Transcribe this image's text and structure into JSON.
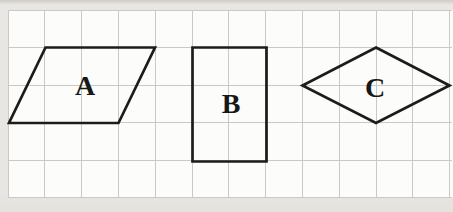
{
  "canvas": {
    "width": 453,
    "height": 212,
    "outer_background": "#e8e6e2",
    "panel_background": "#fcfcfa"
  },
  "grid": {
    "left": 8,
    "top": 10,
    "right": 452,
    "bottom": 197.5,
    "cols": 12,
    "rows": 5,
    "cell_width": 36.8,
    "cell_height": 37.5,
    "line_color": "#c9c9c7",
    "line_width": 1
  },
  "shape_style": {
    "stroke_color": "#1c1c1a",
    "stroke_width": 2.7,
    "fill": "none",
    "label_color": "#171715",
    "label_font_size": 28
  },
  "shapes": [
    {
      "name": "parallelogram-a",
      "type": "parallelogram",
      "label": "A",
      "points": [
        [
          45.5,
          47.5
        ],
        [
          155,
          47.5
        ],
        [
          118.5,
          123
        ],
        [
          9,
          123
        ]
      ],
      "label_x": 85,
      "label_y": 85
    },
    {
      "name": "rectangle-b",
      "type": "rectangle",
      "label": "B",
      "points": [
        [
          192.5,
          47.5
        ],
        [
          266.5,
          47.5
        ],
        [
          266.5,
          161.5
        ],
        [
          192.5,
          161.5
        ]
      ],
      "label_x": 231,
      "label_y": 103
    },
    {
      "name": "rhombus-c",
      "type": "rhombus",
      "label": "C",
      "points": [
        [
          376,
          47.5
        ],
        [
          449.5,
          85.5
        ],
        [
          376,
          123
        ],
        [
          302.5,
          85.5
        ]
      ],
      "label_x": 375,
      "label_y": 87
    }
  ]
}
